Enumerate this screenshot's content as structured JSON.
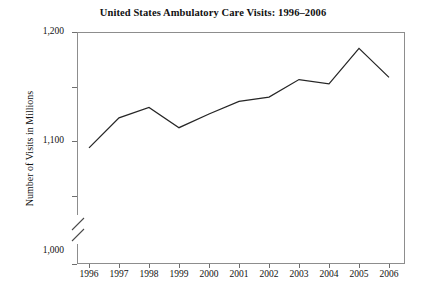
{
  "chart_data": {
    "type": "line",
    "title": "United States Ambulatory Care Visits: 1996–2006",
    "xlabel": "",
    "ylabel": "Number of Visits in Millions",
    "categories": [
      "1996",
      "1997",
      "1998",
      "1999",
      "2000",
      "2001",
      "2002",
      "2003",
      "2004",
      "2005",
      "2006"
    ],
    "x": [
      1996,
      1997,
      1998,
      1999,
      2000,
      2001,
      2002,
      2003,
      2004,
      2005,
      2006
    ],
    "values": [
      988,
      1043,
      1062,
      1025,
      1050,
      1073,
      1081,
      1113,
      1105,
      1170,
      1117
    ],
    "series": [
      {
        "name": "Ambulatory Care Visits",
        "values": [
          988,
          1043,
          1062,
          1025,
          1050,
          1073,
          1081,
          1113,
          1105,
          1170,
          1117
        ]
      }
    ],
    "ylim": [
      900,
      1200
    ],
    "y_tick_labels": [
      "1,200",
      "1,100",
      "1,000",
      "990",
      "0"
    ],
    "y_tick_values": [
      1200,
      1100,
      1000,
      900,
      0
    ],
    "axis_break": true,
    "axis_break_between": [
      "990",
      "0"
    ],
    "grid": false,
    "legend": false,
    "line_color": "#262626",
    "frame_color": "#8d8d8d",
    "background_color": "#ffffff"
  }
}
